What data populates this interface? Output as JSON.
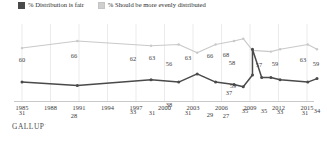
{
  "legend": {
    "items": [
      {
        "label": "% Distribution is fair",
        "color": "#4a4a4a",
        "icon": "square-swatch-icon"
      },
      {
        "label": "% Should be more evenly distributed",
        "color": "#c9c9c9",
        "icon": "square-swatch-icon"
      }
    ]
  },
  "footer": {
    "brand": "GALLUP",
    "mark": "·"
  },
  "chart_data": {
    "type": "line",
    "title": "",
    "subtitle": "",
    "xlabel": "",
    "ylabel": "",
    "grid": true,
    "legend_position": "top-left",
    "ylim": [
      20,
      72
    ],
    "xlim": [
      1984,
      2016
    ],
    "xticks": [
      "1985",
      "1988",
      "1991",
      "1994",
      "1997",
      "2000",
      "2003",
      "2006",
      "2009",
      "2012",
      "2015"
    ],
    "series": [
      {
        "name": "% Should be more evenly distributed",
        "color": "#c9c9c9",
        "points": [
          {
            "x": 1984,
            "y": 60,
            "label": "60",
            "lx": 22,
            "ly": 35
          },
          {
            "x": 1990,
            "y": 66,
            "label": "66",
            "lx": 74,
            "ly": 31
          },
          {
            "x": 1998,
            "y": 62,
            "label": "62",
            "lx": 133,
            "ly": 34
          },
          {
            "x": 2001,
            "y": 63,
            "label": "63",
            "lx": 152,
            "ly": 33
          },
          {
            "x": 2003,
            "y": 56,
            "label": "56",
            "lx": 169,
            "ly": 39
          },
          {
            "x": 2005,
            "y": 63,
            "label": "63",
            "lx": 188,
            "ly": 33
          },
          {
            "x": 2007,
            "y": 66,
            "label": "66",
            "lx": 210,
            "ly": 31
          },
          {
            "x": 2008,
            "y": 68,
            "label": "68",
            "lx": 226,
            "ly": 30
          },
          {
            "x": 2009,
            "y": 58,
            "label": "58",
            "lx": 232,
            "ly": 38
          },
          {
            "x": 2011,
            "y": 57,
            "label": "57",
            "lx": 259,
            "ly": 40
          },
          {
            "x": 2012,
            "y": 59,
            "label": "59",
            "lx": 275,
            "ly": 39
          },
          {
            "x": 2015,
            "y": 63,
            "label": "63",
            "lx": 303,
            "ly": 35
          },
          {
            "x": 2016,
            "y": 59,
            "label": "59",
            "lx": 316,
            "ly": 39
          }
        ]
      },
      {
        "name": "% Distribution is fair",
        "color": "#4a4a4a",
        "points": [
          {
            "x": 1984,
            "y": 31,
            "label": "31",
            "lx": 22,
            "ly": 88
          },
          {
            "x": 1990,
            "y": 28,
            "label": "28",
            "lx": 74,
            "ly": 91
          },
          {
            "x": 1998,
            "y": 33,
            "label": "33",
            "lx": 133,
            "ly": 87
          },
          {
            "x": 2001,
            "y": 31,
            "label": "31",
            "lx": 152,
            "ly": 88
          },
          {
            "x": 2003,
            "y": 38,
            "label": "38",
            "lx": 169,
            "ly": 80
          },
          {
            "x": 2005,
            "y": 31,
            "label": "31",
            "lx": 188,
            "ly": 88
          },
          {
            "x": 2007,
            "y": 29,
            "label": "29",
            "lx": 210,
            "ly": 90
          },
          {
            "x": 2008,
            "y": 27,
            "label": "27",
            "lx": 226,
            "ly": 91
          },
          {
            "x": 2009,
            "y": 37,
            "label": "37",
            "lx": 229,
            "ly": 68
          },
          {
            "x": 2009,
            "y": 59,
            "label": "59",
            "lx": 233,
            "ly": 61
          },
          {
            "x": 2010,
            "y": 35,
            "label": "35",
            "lx": 245,
            "ly": 86
          },
          {
            "x": 2011,
            "y": 35,
            "label": "35",
            "lx": 264,
            "ly": 86
          },
          {
            "x": 2012,
            "y": 33,
            "label": "33",
            "lx": 280,
            "ly": 87
          },
          {
            "x": 2015,
            "y": 31,
            "label": "31",
            "lx": 305,
            "ly": 88
          },
          {
            "x": 2016,
            "y": 34,
            "label": "34",
            "lx": 317,
            "ly": 86
          }
        ]
      }
    ]
  }
}
